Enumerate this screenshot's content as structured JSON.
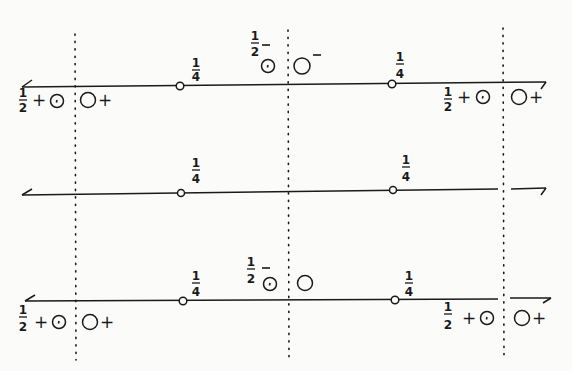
{
  "diagram": {
    "type": "number-line-sign-charts",
    "colors": {
      "ink": "#1a1a1a",
      "background": "#fbfbf9"
    },
    "vertical_dotted_lines_x": [
      75,
      288,
      503
    ],
    "lines": [
      {
        "id": "top",
        "y": 84,
        "left_arrow": true,
        "right_arrow": true,
        "open_points": [
          {
            "x": 180,
            "label_num": "1",
            "label_den": "4"
          },
          {
            "x": 392,
            "label_num": "1",
            "label_den": "4"
          }
        ],
        "annotations": {
          "left_frac": {
            "num": "1",
            "den": "2"
          },
          "left_sign1": "+",
          "left_sign2": "+",
          "mid_frac": {
            "num": "1",
            "den": "2"
          },
          "mid_sign": "−",
          "mid_sign2": "−",
          "right_frac": {
            "num": "1",
            "den": "2"
          },
          "right_sign1": "+",
          "right_sign2": "+",
          "dot_circle_symbol": "⊙",
          "circle_symbol": "○"
        }
      },
      {
        "id": "middle",
        "y": 191,
        "left_arrow": true,
        "right_arrow": true,
        "open_points": [
          {
            "x": 181,
            "label_num": "1",
            "label_den": "4"
          },
          {
            "x": 393,
            "label_num": "1",
            "label_den": "4"
          }
        ]
      },
      {
        "id": "bottom",
        "y": 301,
        "left_arrow": true,
        "right_arrow": true,
        "open_points": [
          {
            "x": 182,
            "label_num": "1",
            "label_den": "4"
          },
          {
            "x": 394,
            "label_num": "1",
            "label_den": "4"
          }
        ],
        "annotations": {
          "left_frac": {
            "num": "1",
            "den": "2"
          },
          "left_sign1": "+",
          "left_sign2": "+",
          "mid_frac": {
            "num": "1",
            "den": "2"
          },
          "mid_sign": "−",
          "right_frac": {
            "num": "1",
            "den": "2"
          },
          "right_sign1": "+",
          "right_sign2": "+"
        }
      }
    ]
  }
}
